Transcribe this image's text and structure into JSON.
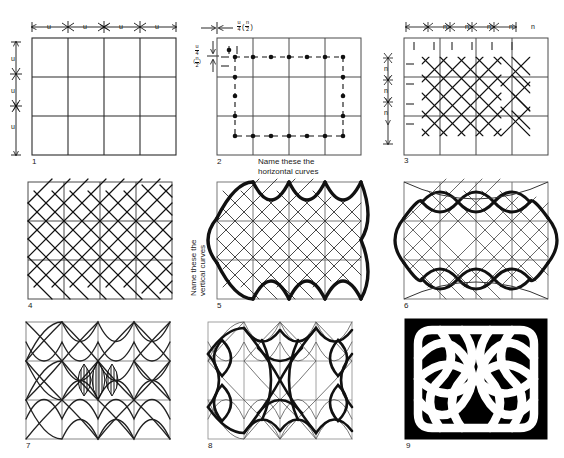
{
  "figure": {
    "title_faint": "",
    "panel_count": 9,
    "layout": "3x3 grid of construction steps"
  },
  "labels": {
    "unit_u": "u",
    "unit_n": "n",
    "u_over_4": {
      "num": "u",
      "den": "4"
    },
    "n_over_2": {
      "num": "n",
      "den": "2"
    },
    "caption_horizontal": "Name these the",
    "caption_horizontal2": "horizontal curves",
    "caption_vertical": "Name these the",
    "caption_vertical2": "vertical curves"
  },
  "panels": [
    {
      "n": "1",
      "desc": "Blank 4x3 construction grid with u spacing marks on top and left"
    },
    {
      "n": "2",
      "desc": "Grid with dotted/dashed inner rectangle and node dots at u/4 (n/2) offsets"
    },
    {
      "n": "3",
      "desc": "Grid overlaid with small diagonal diamond lattice, n spacing marks"
    },
    {
      "n": "4",
      "desc": "Denser diagonal diamond lattice filling the grid"
    },
    {
      "n": "5",
      "desc": "Lattice plus bold outer arcs; vertical curves named"
    },
    {
      "n": "6",
      "desc": "Lattice plus bold interlaced loop curves forming knot skeleton"
    },
    {
      "n": "7",
      "desc": "Full curve network with a shaded band highlighted at the centre"
    },
    {
      "n": "8",
      "desc": "Thickened double-line bands over the curve network"
    },
    {
      "n": "9",
      "desc": "Finished Celtic knot, white bands on solid black ground"
    }
  ],
  "colors": {
    "ink": "#1a1a1a",
    "grid": "#3a3a3a",
    "light_grid": "#9a9a9a",
    "paper": "#ffffff",
    "knot_ground": "#000000",
    "knot_band": "#ffffff"
  },
  "panel_numbers": [
    "1",
    "2",
    "3",
    "4",
    "5",
    "6",
    "7",
    "8",
    "9"
  ]
}
